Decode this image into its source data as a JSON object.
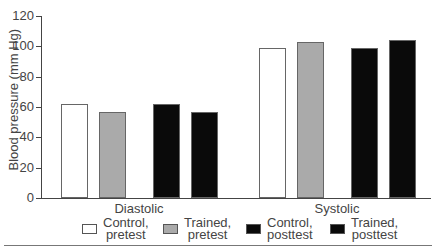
{
  "chart_data": {
    "type": "bar",
    "title": "",
    "xlabel": "",
    "ylabel": "Blood pressure (mm Hg)",
    "ylim": [
      0,
      120
    ],
    "yticks": [
      0,
      20,
      40,
      60,
      80,
      100,
      120
    ],
    "grid": false,
    "legend_position": "bottom",
    "categories": [
      "Diastolic",
      "Systolic"
    ],
    "series": [
      {
        "name": "Control, pretest",
        "color": "#ffffff",
        "values": [
          62,
          99
        ]
      },
      {
        "name": "Trained, pretest",
        "color": "#aaaaaa",
        "values": [
          57,
          103
        ]
      },
      {
        "name": "Control, posttest",
        "color": "#0a0a0a",
        "values": [
          62,
          99
        ]
      },
      {
        "name": "Trained, posttest",
        "color": "#0a0a0a",
        "values": [
          57,
          104
        ]
      }
    ]
  },
  "legend": [
    {
      "line1": "Control,",
      "line2": "pretest"
    },
    {
      "line1": "Trained,",
      "line2": "pretest"
    },
    {
      "line1": "Control,",
      "line2": "posttest"
    },
    {
      "line1": "Trained,",
      "line2": "posttest"
    }
  ]
}
